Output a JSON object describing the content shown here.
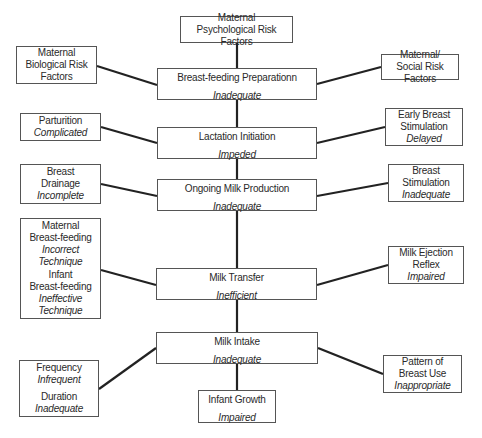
{
  "diagram": {
    "central_chain": [
      {
        "title": "Breast-feeding Preparationn",
        "status": "Inadequate"
      },
      {
        "title": "Lactation Initiation",
        "status": "Impeded"
      },
      {
        "title": "Ongoing Milk Production",
        "status": "Inadequate"
      },
      {
        "title": "Milk Transfer",
        "status": "Inefficient"
      },
      {
        "title": "Milk Intake",
        "status": "Inadequate"
      },
      {
        "title": "Infant Growth",
        "status": "Impaired"
      }
    ],
    "factors": {
      "maternal_psychological": {
        "line1": "Maternal",
        "line2": "Psychological Risk Factors"
      },
      "maternal_biological": {
        "line1": "Maternal",
        "line2": "Biological Risk",
        "line3": "Factors"
      },
      "maternal_social": {
        "line1": "Maternal/",
        "line2": "Social Risk Factors"
      },
      "parturition": {
        "title": "Parturition",
        "status": "Complicated"
      },
      "early_breast_stimulation": {
        "line1": "Early Breast",
        "line2": "Stimulation",
        "status": "Delayed"
      },
      "breast_drainage": {
        "line1": "Breast",
        "line2": "Drainage",
        "status": "Incomplete"
      },
      "breast_stimulation": {
        "line1": "Breast",
        "line2": "Stimulation",
        "status": "Inadequate"
      },
      "maternal_bf": {
        "line1": "Maternal",
        "line2": "Breast-feeding",
        "status1": "Incorrect",
        "status2": "Technique"
      },
      "infant_bf": {
        "line1": "Infant",
        "line2": "Breast-feeding",
        "status1": "Ineffective",
        "status2": "Technique"
      },
      "milk_ejection": {
        "line1": "Milk Ejection",
        "line2": "Reflex",
        "status": "Impaired"
      },
      "frequency": {
        "title": "Frequency",
        "status": "Infrequent"
      },
      "duration": {
        "title": "Duration",
        "status": "Inadequate"
      },
      "pattern_breast_use": {
        "line1": "Pattern of",
        "line2": "Breast Use",
        "status": "Inappropriate"
      }
    }
  }
}
